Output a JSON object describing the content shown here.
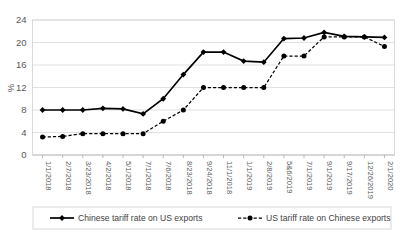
{
  "chart_data": {
    "type": "line",
    "title": "",
    "xlabel": "",
    "ylabel": "%",
    "ylim": [
      0,
      24
    ],
    "yticks": [
      0,
      4,
      8,
      12,
      16,
      20,
      24
    ],
    "grid": true,
    "legend_position": "bottom",
    "categories": [
      "1/1/2018",
      "2/7/2018",
      "3/23/2018",
      "4/2/2018",
      "5/1/2018",
      "7/1/2018",
      "7/6/2018",
      "8/23/2018",
      "9/24/2018",
      "11/1/2018",
      "1/1/2019",
      "2/8/2019",
      "5&6/2019",
      "7/1/2019",
      "9/1/2019",
      "9/17/2019",
      "12/26/2019",
      "2/1/2020"
    ],
    "series": [
      {
        "name": "Chinese tariff rate on US exports",
        "style": "solid",
        "marker": "diamond",
        "values": [
          8.0,
          8.0,
          8.0,
          8.3,
          8.2,
          7.3,
          10.0,
          14.3,
          18.3,
          18.3,
          16.7,
          16.5,
          20.7,
          20.8,
          21.8,
          21.1,
          21.0,
          20.9
        ]
      },
      {
        "name": "US tariff rate on Chinese exports",
        "style": "dashed",
        "marker": "circle",
        "values": [
          3.2,
          3.3,
          3.8,
          3.8,
          3.8,
          3.8,
          6.0,
          8.0,
          12.0,
          12.0,
          12.0,
          12.0,
          17.6,
          17.6,
          21.0,
          21.0,
          21.0,
          19.3
        ]
      }
    ]
  },
  "legend": {
    "items": [
      {
        "label": "Chinese tariff rate on US exports",
        "style": "solid",
        "marker": "diamond"
      },
      {
        "label": "US tariff rate on Chinese exports",
        "style": "dashed",
        "marker": "circle"
      }
    ]
  }
}
